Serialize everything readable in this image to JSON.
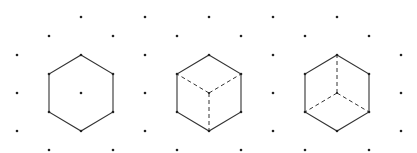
{
  "figure": {
    "colors": {
      "line": "#333333",
      "dot": "#222222",
      "background": "#ffffff"
    },
    "grid": {
      "x_start": 17,
      "x_step": 32,
      "columns": 13,
      "even_column_rows": [
        17,
        55,
        93,
        131
      ],
      "odd_column_rows": [
        36,
        74,
        112,
        150
      ]
    },
    "dots": [
      [
        17,
        55
      ],
      [
        17,
        93
      ],
      [
        17,
        131
      ],
      [
        49,
        36
      ],
      [
        49,
        150
      ],
      [
        81,
        17
      ],
      [
        81,
        93
      ],
      [
        113,
        36
      ],
      [
        113,
        150
      ],
      [
        145,
        17
      ],
      [
        145,
        55
      ],
      [
        145,
        93
      ],
      [
        145,
        131
      ],
      [
        177,
        36
      ],
      [
        177,
        150
      ],
      [
        209,
        17
      ],
      [
        241,
        36
      ],
      [
        241,
        150
      ],
      [
        273,
        17
      ],
      [
        273,
        55
      ],
      [
        273,
        93
      ],
      [
        273,
        131
      ],
      [
        305,
        36
      ],
      [
        305,
        150
      ],
      [
        337,
        17
      ],
      [
        369,
        36
      ],
      [
        369,
        150
      ],
      [
        401,
        55
      ],
      [
        401,
        93
      ],
      [
        401,
        131
      ]
    ],
    "shapes": [
      {
        "name": "hexagon",
        "center": [
          81,
          93
        ],
        "outline": [
          [
            81,
            55
          ],
          [
            113,
            74
          ],
          [
            113,
            112
          ],
          [
            81,
            131
          ],
          [
            49,
            112
          ],
          [
            49,
            74
          ]
        ],
        "solid_inner": [],
        "dashed_inner": []
      },
      {
        "name": "cube-top-view",
        "center": [
          209,
          93
        ],
        "outline": [
          [
            209,
            55
          ],
          [
            241,
            74
          ],
          [
            241,
            112
          ],
          [
            209,
            131
          ],
          [
            177,
            112
          ],
          [
            177,
            74
          ]
        ],
        "solid_inner": [],
        "dashed_inner": [
          [
            [
              209,
              93
            ],
            [
              177,
              74
            ]
          ],
          [
            [
              209,
              93
            ],
            [
              241,
              74
            ]
          ],
          [
            [
              209,
              93
            ],
            [
              209,
              131
            ]
          ]
        ]
      },
      {
        "name": "cube-bottom-view",
        "center": [
          337,
          93
        ],
        "outline": [
          [
            337,
            55
          ],
          [
            369,
            74
          ],
          [
            369,
            112
          ],
          [
            337,
            131
          ],
          [
            305,
            112
          ],
          [
            305,
            74
          ]
        ],
        "solid_inner": [],
        "dashed_inner": [
          [
            [
              337,
              93
            ],
            [
              337,
              55
            ]
          ],
          [
            [
              337,
              93
            ],
            [
              305,
              112
            ]
          ],
          [
            [
              337,
              93
            ],
            [
              369,
              112
            ]
          ]
        ]
      }
    ]
  }
}
